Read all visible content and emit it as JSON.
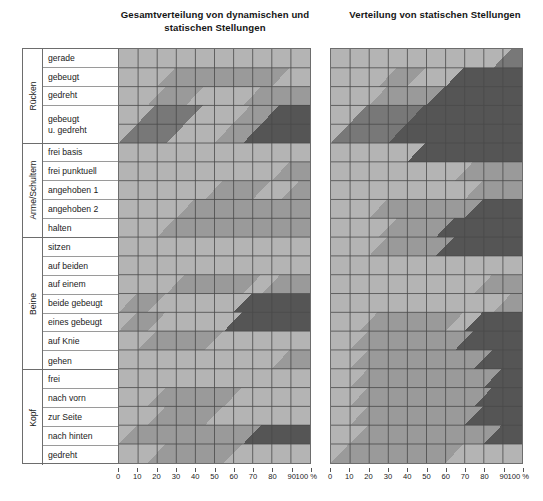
{
  "titles": {
    "left": "Gesamtverteilung von dynamischen und statischen Stellungen",
    "right": "Verteilung von statischen Stellungen"
  },
  "axis": {
    "unit": "%",
    "ticks": [
      "0",
      "10",
      "20",
      "30",
      "40",
      "50",
      "60",
      "70",
      "80",
      "90",
      "100 %"
    ],
    "min": 0,
    "max": 100
  },
  "palette": {
    "band1": "#b4b4b4",
    "band2": "#9a9a9a",
    "band3": "#787878",
    "band4": "#555555",
    "grid": "#4a4a4a",
    "frame": "#6d6d6d"
  },
  "groups": [
    {
      "name": "Rücken",
      "rows": [
        {
          "label": "gerade",
          "h": 1
        },
        {
          "label": "gebeugt",
          "h": 1
        },
        {
          "label": "gedreht",
          "h": 1
        },
        {
          "label": "gebeugt\nu. gedreht",
          "h": 2
        }
      ]
    },
    {
      "name": "Arme/Schultern",
      "rows": [
        {
          "label": "frei basis",
          "h": 1
        },
        {
          "label": "frei punktuell",
          "h": 1
        },
        {
          "label": "angehoben 1",
          "h": 1
        },
        {
          "label": "angehoben 2",
          "h": 1
        },
        {
          "label": "halten",
          "h": 1
        }
      ]
    },
    {
      "name": "Beine",
      "rows": [
        {
          "label": "sitzen",
          "h": 1
        },
        {
          "label": "auf beiden",
          "h": 1
        },
        {
          "label": "auf einem",
          "h": 1
        },
        {
          "label": "beide gebeugt",
          "h": 1
        },
        {
          "label": "eines gebeugt",
          "h": 1
        },
        {
          "label": "auf Knie",
          "h": 1
        },
        {
          "label": "gehen",
          "h": 1
        }
      ]
    },
    {
      "name": "Kopf",
      "rows": [
        {
          "label": "frei",
          "h": 1
        },
        {
          "label": "nach vorn",
          "h": 1
        },
        {
          "label": "zur Seite",
          "h": 1
        },
        {
          "label": "nach hinten",
          "h": 1
        },
        {
          "label": "gedreht",
          "h": 1
        }
      ]
    }
  ],
  "chart_data": {
    "type": "area",
    "xlabel": "%",
    "ylabel": "",
    "xlim": [
      0,
      100
    ],
    "grid": true,
    "legend": "none",
    "note": "Each row is a horizontal band whose shading level encodes a load class (1 = lightest .. 4 = darkest). Breakpoints are given in percent along the x axis; each segment lists the class and the x-range it covers, with diagonal transitions between adjacent rows.",
    "charts": [
      {
        "name": "Gesamtverteilung von dynamischen und statischen Stellungen",
        "rows": [
          {
            "row": "gerade",
            "segments": [
              {
                "class": 1,
                "x0": 0,
                "x1": 100
              }
            ]
          },
          {
            "row": "gebeugt",
            "segments": [
              {
                "class": 1,
                "x0": 0,
                "x1": 20
              },
              {
                "class": 2,
                "x0": 20,
                "x1": 80
              },
              {
                "class": 1,
                "x0": 80,
                "x1": 100
              }
            ]
          },
          {
            "row": "gedreht",
            "segments": [
              {
                "class": 1,
                "x0": 0,
                "x1": 15
              },
              {
                "class": 2,
                "x0": 15,
                "x1": 35
              },
              {
                "class": 1,
                "x0": 35,
                "x1": 65
              },
              {
                "class": 2,
                "x0": 65,
                "x1": 100
              }
            ]
          },
          {
            "row": "gebeugt u. gedreht",
            "segments": [
              {
                "class": 3,
                "x0": 0,
                "x1": 25
              },
              {
                "class": 1,
                "x0": 25,
                "x1": 50
              },
              {
                "class": 2,
                "x0": 50,
                "x1": 65
              },
              {
                "class": 4,
                "x0": 65,
                "x1": 100
              }
            ]
          },
          {
            "row": "frei basis",
            "segments": [
              {
                "class": 1,
                "x0": 0,
                "x1": 100
              }
            ]
          },
          {
            "row": "frei punktuell",
            "segments": [
              {
                "class": 1,
                "x0": 0,
                "x1": 80
              },
              {
                "class": 2,
                "x0": 80,
                "x1": 100
              }
            ]
          },
          {
            "row": "angehoben 1",
            "segments": [
              {
                "class": 1,
                "x0": 0,
                "x1": 45
              },
              {
                "class": 2,
                "x0": 45,
                "x1": 70
              },
              {
                "class": 1,
                "x0": 70,
                "x1": 85
              },
              {
                "class": 2,
                "x0": 85,
                "x1": 100
              }
            ]
          },
          {
            "row": "angehoben 2",
            "segments": [
              {
                "class": 1,
                "x0": 0,
                "x1": 30
              },
              {
                "class": 2,
                "x0": 30,
                "x1": 100
              }
            ]
          },
          {
            "row": "halten",
            "segments": [
              {
                "class": 1,
                "x0": 0,
                "x1": 20
              },
              {
                "class": 2,
                "x0": 20,
                "x1": 100
              }
            ]
          },
          {
            "row": "sitzen",
            "segments": [
              {
                "class": 1,
                "x0": 0,
                "x1": 100
              }
            ]
          },
          {
            "row": "auf beiden",
            "segments": [
              {
                "class": 1,
                "x0": 0,
                "x1": 100
              }
            ]
          },
          {
            "row": "auf einem",
            "segments": [
              {
                "class": 1,
                "x0": 0,
                "x1": 25
              },
              {
                "class": 2,
                "x0": 25,
                "x1": 65
              },
              {
                "class": 1,
                "x0": 65,
                "x1": 75
              },
              {
                "class": 2,
                "x0": 75,
                "x1": 100
              }
            ]
          },
          {
            "row": "beide gebeugt",
            "segments": [
              {
                "class": 2,
                "x0": 0,
                "x1": 15
              },
              {
                "class": 1,
                "x0": 15,
                "x1": 60
              },
              {
                "class": 4,
                "x0": 60,
                "x1": 100
              }
            ]
          },
          {
            "row": "eines gebeugt",
            "segments": [
              {
                "class": 2,
                "x0": 0,
                "x1": 15
              },
              {
                "class": 1,
                "x0": 15,
                "x1": 55
              },
              {
                "class": 4,
                "x0": 55,
                "x1": 100
              }
            ]
          },
          {
            "row": "auf Knie",
            "segments": [
              {
                "class": 1,
                "x0": 0,
                "x1": 10
              },
              {
                "class": 2,
                "x0": 10,
                "x1": 45
              },
              {
                "class": 1,
                "x0": 45,
                "x1": 100
              }
            ]
          },
          {
            "row": "gehen",
            "segments": [
              {
                "class": 1,
                "x0": 0,
                "x1": 80
              },
              {
                "class": 2,
                "x0": 80,
                "x1": 100
              }
            ]
          },
          {
            "row": "frei",
            "segments": [
              {
                "class": 1,
                "x0": 0,
                "x1": 100
              }
            ]
          },
          {
            "row": "nach vorn",
            "segments": [
              {
                "class": 1,
                "x0": 0,
                "x1": 15
              },
              {
                "class": 2,
                "x0": 15,
                "x1": 55
              },
              {
                "class": 1,
                "x0": 55,
                "x1": 100
              }
            ]
          },
          {
            "row": "zur Seite",
            "segments": [
              {
                "class": 1,
                "x0": 0,
                "x1": 15
              },
              {
                "class": 2,
                "x0": 15,
                "x1": 45
              },
              {
                "class": 1,
                "x0": 45,
                "x1": 100
              }
            ]
          },
          {
            "row": "nach hinten",
            "segments": [
              {
                "class": 2,
                "x0": 0,
                "x1": 65
              },
              {
                "class": 4,
                "x0": 65,
                "x1": 100
              }
            ]
          },
          {
            "row": "gedreht",
            "segments": [
              {
                "class": 1,
                "x0": 0,
                "x1": 15
              },
              {
                "class": 2,
                "x0": 15,
                "x1": 55
              },
              {
                "class": 1,
                "x0": 55,
                "x1": 100
              }
            ]
          }
        ]
      },
      {
        "name": "Verteilung von statischen Stellungen",
        "rows": [
          {
            "row": "gerade",
            "segments": [
              {
                "class": 1,
                "x0": 0,
                "x1": 85
              },
              {
                "class": 3,
                "x0": 85,
                "x1": 100
              }
            ]
          },
          {
            "row": "gebeugt",
            "segments": [
              {
                "class": 1,
                "x0": 0,
                "x1": 25
              },
              {
                "class": 2,
                "x0": 25,
                "x1": 40
              },
              {
                "class": 1,
                "x0": 40,
                "x1": 60
              },
              {
                "class": 4,
                "x0": 60,
                "x1": 100
              }
            ]
          },
          {
            "row": "gedreht",
            "segments": [
              {
                "class": 1,
                "x0": 0,
                "x1": 20
              },
              {
                "class": 2,
                "x0": 20,
                "x1": 50
              },
              {
                "class": 4,
                "x0": 50,
                "x1": 100
              }
            ]
          },
          {
            "row": "gebeugt u. gedreht",
            "segments": [
              {
                "class": 3,
                "x0": 0,
                "x1": 30
              },
              {
                "class": 4,
                "x0": 30,
                "x1": 100
              }
            ]
          },
          {
            "row": "frei basis",
            "segments": [
              {
                "class": 1,
                "x0": 0,
                "x1": 40
              },
              {
                "class": 4,
                "x0": 40,
                "x1": 100
              }
            ]
          },
          {
            "row": "frei punktuell",
            "segments": [
              {
                "class": 1,
                "x0": 0,
                "x1": 65
              },
              {
                "class": 2,
                "x0": 65,
                "x1": 100
              }
            ]
          },
          {
            "row": "angehoben 1",
            "segments": [
              {
                "class": 1,
                "x0": 0,
                "x1": 70
              },
              {
                "class": 2,
                "x0": 70,
                "x1": 100
              }
            ]
          },
          {
            "row": "angehoben 2",
            "segments": [
              {
                "class": 1,
                "x0": 0,
                "x1": 20
              },
              {
                "class": 2,
                "x0": 20,
                "x1": 70
              },
              {
                "class": 4,
                "x0": 70,
                "x1": 100
              }
            ]
          },
          {
            "row": "halten",
            "segments": [
              {
                "class": 1,
                "x0": 0,
                "x1": 25
              },
              {
                "class": 2,
                "x0": 25,
                "x1": 55
              },
              {
                "class": 4,
                "x0": 55,
                "x1": 100
              }
            ]
          },
          {
            "row": "sitzen",
            "segments": [
              {
                "class": 1,
                "x0": 0,
                "x1": 20
              },
              {
                "class": 2,
                "x0": 20,
                "x1": 55
              },
              {
                "class": 4,
                "x0": 55,
                "x1": 100
              }
            ]
          },
          {
            "row": "auf beiden",
            "segments": [
              {
                "class": 1,
                "x0": 0,
                "x1": 100
              }
            ]
          },
          {
            "row": "auf einem",
            "segments": [
              {
                "class": 1,
                "x0": 0,
                "x1": 75
              },
              {
                "class": 2,
                "x0": 75,
                "x1": 100
              }
            ]
          },
          {
            "row": "beide gebeugt",
            "segments": [
              {
                "class": 1,
                "x0": 0,
                "x1": 85
              },
              {
                "class": 2,
                "x0": 85,
                "x1": 100
              }
            ]
          },
          {
            "row": "eines gebeugt",
            "segments": [
              {
                "class": 1,
                "x0": 0,
                "x1": 15
              },
              {
                "class": 2,
                "x0": 15,
                "x1": 60
              },
              {
                "class": 1,
                "x0": 60,
                "x1": 70
              },
              {
                "class": 4,
                "x0": 70,
                "x1": 100
              }
            ]
          },
          {
            "row": "auf Knie",
            "segments": [
              {
                "class": 1,
                "x0": 0,
                "x1": 10
              },
              {
                "class": 2,
                "x0": 10,
                "x1": 65
              },
              {
                "class": 4,
                "x0": 65,
                "x1": 100
              }
            ]
          },
          {
            "row": "gehen",
            "segments": [
              {
                "class": 1,
                "x0": 0,
                "x1": 10
              },
              {
                "class": 2,
                "x0": 10,
                "x1": 75
              },
              {
                "class": 4,
                "x0": 75,
                "x1": 100
              }
            ]
          },
          {
            "row": "frei",
            "segments": [
              {
                "class": 1,
                "x0": 0,
                "x1": 10
              },
              {
                "class": 2,
                "x0": 10,
                "x1": 80
              },
              {
                "class": 4,
                "x0": 80,
                "x1": 100
              }
            ]
          },
          {
            "row": "nach vorn",
            "segments": [
              {
                "class": 1,
                "x0": 0,
                "x1": 10
              },
              {
                "class": 2,
                "x0": 10,
                "x1": 75
              },
              {
                "class": 4,
                "x0": 75,
                "x1": 100
              }
            ]
          },
          {
            "row": "zur Seite",
            "segments": [
              {
                "class": 1,
                "x0": 0,
                "x1": 10
              },
              {
                "class": 2,
                "x0": 10,
                "x1": 70
              },
              {
                "class": 4,
                "x0": 70,
                "x1": 100
              }
            ]
          },
          {
            "row": "nach hinten",
            "segments": [
              {
                "class": 1,
                "x0": 0,
                "x1": 10
              },
              {
                "class": 2,
                "x0": 10,
                "x1": 80
              },
              {
                "class": 4,
                "x0": 80,
                "x1": 100
              }
            ]
          },
          {
            "row": "gedreht",
            "segments": [
              {
                "class": 2,
                "x0": 0,
                "x1": 60
              },
              {
                "class": 1,
                "x0": 60,
                "x1": 100
              }
            ]
          }
        ]
      }
    ]
  }
}
